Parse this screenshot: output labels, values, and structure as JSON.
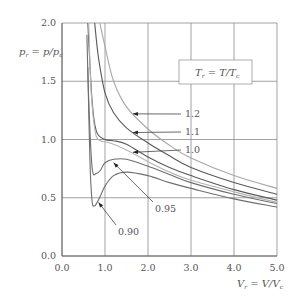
{
  "chart_data": {
    "type": "line",
    "title": "",
    "xlabel": "V_r = V/V_c",
    "ylabel": "p_r = p/p_c",
    "xlim": [
      0.0,
      5.0
    ],
    "ylim": [
      0.0,
      2.0
    ],
    "x_ticks": [
      "0.0",
      "1.0",
      "2.0",
      "3.0",
      "4.0",
      "5.0"
    ],
    "y_ticks": [
      "0.0",
      "0.5",
      "1.0",
      "1.5",
      "2.0"
    ],
    "grid": true,
    "legend_box": "T_r = T/T_c",
    "series": [
      {
        "name": "0.90",
        "T_r": 0.9,
        "color": "#6f6f6f",
        "points": [
          [
            0.6,
            1.62
          ],
          [
            0.65,
            0.8
          ],
          [
            0.7,
            0.47
          ],
          [
            0.75,
            0.43
          ],
          [
            0.8,
            0.45
          ],
          [
            0.9,
            0.52
          ],
          [
            1.0,
            0.6
          ],
          [
            1.2,
            0.69
          ],
          [
            1.5,
            0.72
          ],
          [
            2.0,
            0.69
          ],
          [
            2.5,
            0.63
          ],
          [
            3.0,
            0.58
          ],
          [
            4.0,
            0.49
          ],
          [
            5.0,
            0.42
          ]
        ]
      },
      {
        "name": "0.95",
        "T_r": 0.95,
        "color": "#6f6f6f",
        "points": [
          [
            0.58,
            1.9
          ],
          [
            0.62,
            1.35
          ],
          [
            0.7,
            0.76
          ],
          [
            0.8,
            0.71
          ],
          [
            0.9,
            0.74
          ],
          [
            1.0,
            0.8
          ],
          [
            1.2,
            0.83
          ],
          [
            1.5,
            0.83
          ],
          [
            2.0,
            0.77
          ],
          [
            2.5,
            0.7
          ],
          [
            3.0,
            0.63
          ],
          [
            4.0,
            0.53
          ],
          [
            5.0,
            0.45
          ]
        ]
      },
      {
        "name": "1.0",
        "T_r": 1.0,
        "color": "#5a5a5a",
        "points": [
          [
            0.6,
            2.0
          ],
          [
            0.7,
            1.33
          ],
          [
            0.8,
            1.07
          ],
          [
            1.0,
            1.0
          ],
          [
            1.2,
            0.99
          ],
          [
            1.5,
            0.96
          ],
          [
            2.0,
            0.85
          ],
          [
            2.5,
            0.76
          ],
          [
            3.0,
            0.69
          ],
          [
            4.0,
            0.57
          ],
          [
            5.0,
            0.48
          ]
        ]
      },
      {
        "name": "1.1",
        "T_r": 1.1,
        "color": "#5a5a5a",
        "points": [
          [
            0.76,
            2.0
          ],
          [
            0.85,
            1.7
          ],
          [
            1.0,
            1.4
          ],
          [
            1.2,
            1.23
          ],
          [
            1.5,
            1.1
          ],
          [
            2.0,
            0.97
          ],
          [
            2.5,
            0.86
          ],
          [
            3.0,
            0.76
          ],
          [
            4.0,
            0.63
          ],
          [
            5.0,
            0.53
          ]
        ]
      },
      {
        "name": "1.2",
        "T_r": 1.2,
        "color": "#a8a8a8",
        "points": [
          [
            0.88,
            2.0
          ],
          [
            1.0,
            1.8
          ],
          [
            1.2,
            1.5
          ],
          [
            1.5,
            1.28
          ],
          [
            2.0,
            1.09
          ],
          [
            2.5,
            0.95
          ],
          [
            3.0,
            0.84
          ],
          [
            4.0,
            0.69
          ],
          [
            5.0,
            0.58
          ]
        ]
      },
      {
        "name": "1.0-dashed-light",
        "T_r": 0.95,
        "color": "#b5b5b5",
        "points": [
          [
            0.62,
            2.0
          ],
          [
            0.68,
            1.4
          ],
          [
            0.78,
            1.05
          ],
          [
            0.9,
            0.99
          ],
          [
            1.0,
            0.98
          ],
          [
            1.2,
            0.96
          ],
          [
            1.5,
            0.91
          ],
          [
            2.0,
            0.81
          ],
          [
            2.5,
            0.72
          ],
          [
            3.0,
            0.65
          ],
          [
            4.0,
            0.55
          ],
          [
            5.0,
            0.46
          ]
        ]
      }
    ],
    "annotations": [
      {
        "text": "1.2",
        "arrow_to": [
          1.65,
          1.22
        ]
      },
      {
        "text": "1.1",
        "arrow_to": [
          1.65,
          1.06
        ]
      },
      {
        "text": "1.0",
        "arrow_to": [
          1.65,
          0.89
        ]
      },
      {
        "text": "0.95",
        "arrow_to": [
          1.2,
          0.8
        ]
      },
      {
        "text": "0.90",
        "arrow_to": [
          0.85,
          0.46
        ]
      }
    ]
  },
  "labels": {
    "y_axis": "p",
    "y_axis_sub": "r",
    "y_axis_rest": " = p/p",
    "y_axis_sub2": "c",
    "x_axis": "V",
    "x_axis_sub": "r",
    "x_axis_rest": " = V/V",
    "x_axis_sub2": "c",
    "legend_T": "T",
    "legend_sub": "r",
    "legend_rest": " = T/T",
    "legend_sub2": "c"
  }
}
